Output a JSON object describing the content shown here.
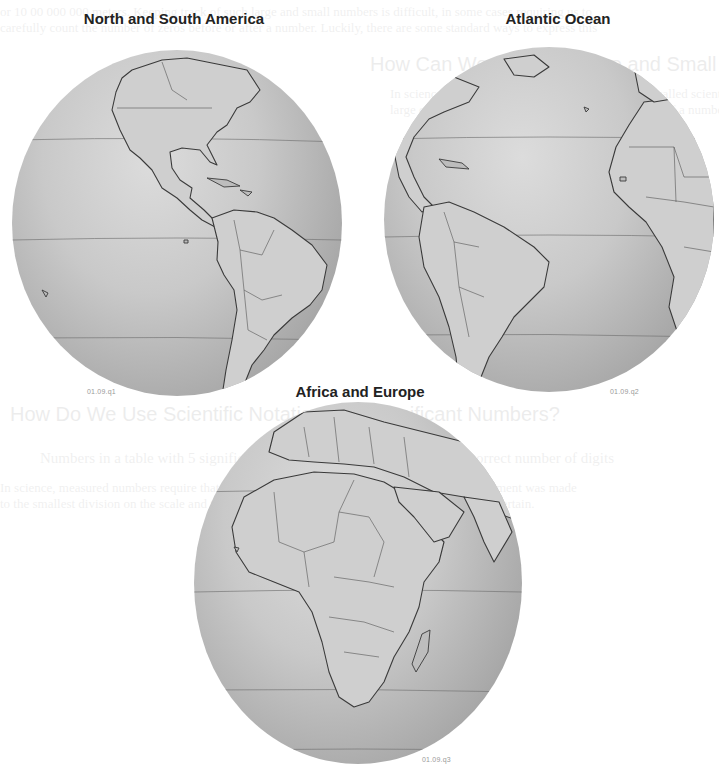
{
  "page": {
    "background": "#ffffff",
    "ghost_text": [
      "or 10 00 000 000 meters. Keeping track of such large and small numbers is difficult, in some cases requiring us to",
      "carefully count the number of zeros before or after a number. Luckily, there are some standard ways to express this",
      "How Can We Express Large and Small Quantities?",
      "In science we use a method of expressing numbers called scientific notation. Scientific notation helps us express",
      "large or small numbers by writing them as a product of a number and a power of 10. By powers of 10 we mean",
      "How Do We Use Scientific Notation with Significant Numbers?",
      "Numbers in a table with 5 significant figures can be expressed with the correct number of digits",
      "In science, measured numbers require that we keep track of the precision with which a measurement was made",
      "to the smallest division on the scale and then estimate one more digit. This estimated digit is uncertain."
    ]
  },
  "figures": [
    {
      "title": "North and South America",
      "figure_id": "01.09.q1",
      "region": "americas"
    },
    {
      "title": "Atlantic Ocean",
      "figure_id": "01.09.q2",
      "region": "atlantic"
    },
    {
      "title": "Africa and Europe",
      "figure_id": "01.09.q3",
      "region": "africa-europe"
    }
  ],
  "colors": {
    "globe_light": "#dcdcdc",
    "globe_shadow": "#8a8a8a",
    "coastline": "#3a3a3a",
    "latitude_line": "#707070",
    "title_text": "#222222",
    "figure_id_text": "#9a9a9a"
  }
}
